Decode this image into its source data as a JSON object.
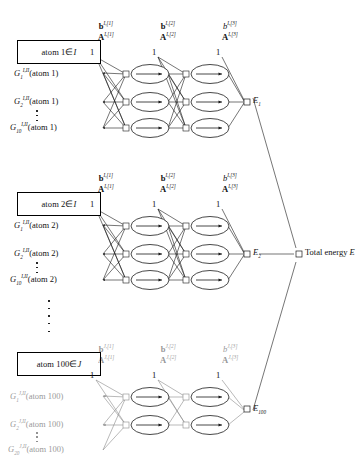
{
  "figure": {
    "type": "neural-network-architecture-diagram",
    "total_energy_label": "Total energy",
    "total_energy_symbol": "E"
  },
  "blocks": [
    {
      "id": "block-atom-1",
      "atom_box": "atom 1",
      "atom_box_member": "∈",
      "atom_box_set": "I",
      "element_type": "I",
      "bias_label": "1",
      "hidden_nodes_layer1": 3,
      "hidden_nodes_layer2": 3,
      "inputs": [
        {
          "sym": "G",
          "sub": "1",
          "sup": "I,II",
          "arg": "(atom 1)"
        },
        {
          "sym": "G",
          "sub": "2",
          "sup": "I,II",
          "arg": "(atom 1)"
        },
        {
          "sym": "G",
          "sub": "10",
          "sup": "I,II",
          "arg": "(atom 1)"
        }
      ],
      "weights": [
        {
          "bias": "b",
          "bias_bold": true,
          "matrix": "A",
          "sup": "I,[1]"
        },
        {
          "bias": "b",
          "bias_bold": true,
          "matrix": "A",
          "sup": "I,[2]"
        },
        {
          "bias": "b",
          "bias_bold": false,
          "matrix": "A",
          "sup": "I,[3]"
        }
      ],
      "output": {
        "sym": "E",
        "sub": "1"
      },
      "faded": false
    },
    {
      "id": "block-atom-2",
      "atom_box": "atom 2",
      "atom_box_member": "∈",
      "atom_box_set": "I",
      "element_type": "I",
      "bias_label": "1",
      "hidden_nodes_layer1": 3,
      "hidden_nodes_layer2": 3,
      "inputs": [
        {
          "sym": "G",
          "sub": "1",
          "sup": "I,II",
          "arg": "(atom 2)"
        },
        {
          "sym": "G",
          "sub": "2",
          "sup": "I,II",
          "arg": "(atom 2)"
        },
        {
          "sym": "G",
          "sub": "10",
          "sup": "I,II",
          "arg": "(atom 2)"
        }
      ],
      "weights": [
        {
          "bias": "b",
          "bias_bold": true,
          "matrix": "A",
          "sup": "I,[1]"
        },
        {
          "bias": "b",
          "bias_bold": true,
          "matrix": "A",
          "sup": "I,[2]"
        },
        {
          "bias": "b",
          "bias_bold": false,
          "matrix": "A",
          "sup": "I,[3]"
        }
      ],
      "output": {
        "sym": "E",
        "sub": "2"
      },
      "faded": false
    },
    {
      "id": "block-atom-100",
      "atom_box": "atom 100",
      "atom_box_member": "∈",
      "atom_box_set": "J",
      "element_type": "J",
      "bias_label": "1",
      "hidden_nodes_layer1": 2,
      "hidden_nodes_layer2": 2,
      "inputs": [
        {
          "sym": "G",
          "sub": "1",
          "sup": "J,II",
          "arg": "(atom 100)"
        },
        {
          "sym": "G",
          "sub": "2",
          "sup": "J,II",
          "arg": "(atom 100)"
        },
        {
          "sym": "G",
          "sub": "20",
          "sup": "J,II",
          "arg": "(atom 100)"
        }
      ],
      "weights": [
        {
          "bias": "b",
          "bias_bold": true,
          "matrix": "A",
          "sup": "J,[1]"
        },
        {
          "bias": "b",
          "bias_bold": true,
          "matrix": "A",
          "sup": "J,[2]"
        },
        {
          "bias": "b",
          "bias_bold": false,
          "matrix": "A",
          "sup": "J,[3]"
        }
      ],
      "output": {
        "sym": "E",
        "sub": "100"
      },
      "faded": true
    }
  ],
  "ellipses": {
    "between_inputs": "⋮",
    "between_blocks": "⋮"
  },
  "colors": {
    "stroke": "#1a1a1a",
    "text": "#111111",
    "background": "#ffffff"
  }
}
